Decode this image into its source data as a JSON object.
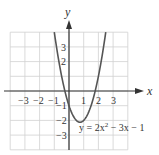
{
  "chart_data": {
    "type": "line",
    "title": "",
    "equation": "y = 2x² − 3x − 1",
    "equation_parts": {
      "pre": "y = 2x",
      "sup": "2",
      "post": " − 3x − 1"
    },
    "xlabel": "x",
    "ylabel": "y",
    "xlim": [
      -4,
      4
    ],
    "ylim": [
      -4,
      4
    ],
    "grid": true,
    "x_ticks": [
      "−3",
      "−2",
      "−1",
      "1",
      "2",
      "3"
    ],
    "y_ticks": [
      "3",
      "2",
      "−1",
      "−2",
      "−3"
    ],
    "series": [
      {
        "name": "y = 2x^2 - 3x - 1",
        "x": [
          -1,
          -0.5,
          0,
          0.5,
          0.75,
          1,
          1.5,
          2,
          2.5
        ],
        "y": [
          4,
          1,
          -1,
          -2,
          -2.125,
          -2,
          -1,
          1,
          4
        ]
      }
    ],
    "colors": {
      "curve": "#555555",
      "grid": "#cccccc",
      "axis": "#333333"
    }
  }
}
